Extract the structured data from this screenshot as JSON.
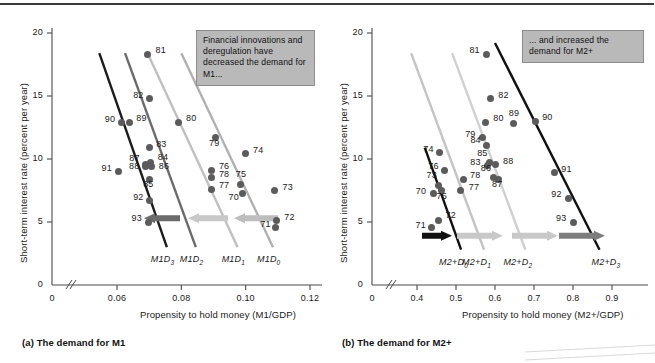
{
  "figure": {
    "top_rule": true
  },
  "panel_a": {
    "caption": "(a) The demand for M1",
    "note": "Financial innovations and deregulation have decreased the demand for M1...",
    "yaxis_title": "Short-term interest rate (percent per year)",
    "xaxis_title": "Propensity to hold money (M1/GDP)",
    "yticks": [
      "20",
      "15",
      "10",
      "5",
      "0"
    ],
    "xticks": [
      "0",
      "0.06",
      "0.08",
      "0.10",
      "0.12"
    ],
    "curve_labels": [
      {
        "base": "M1D",
        "sub": "3"
      },
      {
        "base": "M1D",
        "sub": "2"
      },
      {
        "base": "M1D",
        "sub": "1"
      },
      {
        "base": "M1D",
        "sub": "0"
      }
    ]
  },
  "panel_b": {
    "caption": "(b) The demand for M2+",
    "note": "... and increased the demand for M2+",
    "yaxis_title": "Short-term interest rate (percent per year)",
    "xaxis_title": "Propensity to hold money (M2+/GDP)",
    "yticks": [
      "20",
      "15",
      "10",
      "5",
      "0"
    ],
    "xticks": [
      "0",
      "0.4",
      "0.5",
      "0.6",
      "0.7",
      "0.8",
      "0.9"
    ],
    "curve_labels": [
      {
        "base": "M2+D",
        "sub": "0"
      },
      {
        "base": "M2+D",
        "sub": "1"
      },
      {
        "base": "M2+D",
        "sub": "2"
      },
      {
        "base": "M2+D",
        "sub": "3"
      }
    ]
  },
  "chart_data": [
    {
      "type": "scatter",
      "title": "(a) The demand for M1",
      "xlabel": "Propensity to hold money (M1/GDP)",
      "ylabel": "Short-term interest rate (percent per year)",
      "xlim": [
        0.05,
        0.125
      ],
      "ylim": [
        0,
        20
      ],
      "xticks": [
        0.06,
        0.08,
        0.1,
        0.12
      ],
      "yticks": [
        0,
        5,
        10,
        15,
        20
      ],
      "axis_break_x": true,
      "grid": false,
      "annotation": "Financial innovations and deregulation have decreased the demand for M1...",
      "points": [
        {
          "label": "81",
          "x": 0.0695,
          "y": 18.3
        },
        {
          "label": "82",
          "x": 0.07,
          "y": 14.8
        },
        {
          "label": "90",
          "x": 0.0615,
          "y": 12.9
        },
        {
          "label": "89",
          "x": 0.0638,
          "y": 12.9
        },
        {
          "label": "80",
          "x": 0.079,
          "y": 12.9
        },
        {
          "label": "79",
          "x": 0.0905,
          "y": 11.7
        },
        {
          "label": "83",
          "x": 0.07,
          "y": 10.9
        },
        {
          "label": "74",
          "x": 0.0998,
          "y": 10.4
        },
        {
          "label": "84",
          "x": 0.0705,
          "y": 9.7
        },
        {
          "label": "87",
          "x": 0.0688,
          "y": 9.6
        },
        {
          "label": "88",
          "x": 0.069,
          "y": 9.4
        },
        {
          "label": "86",
          "x": 0.0708,
          "y": 9.4
        },
        {
          "label": "76",
          "x": 0.0895,
          "y": 9.1
        },
        {
          "label": "91",
          "x": 0.0605,
          "y": 9.0
        },
        {
          "label": "78",
          "x": 0.0895,
          "y": 8.5
        },
        {
          "label": "85",
          "x": 0.07,
          "y": 8.4
        },
        {
          "label": "75",
          "x": 0.0985,
          "y": 8.0
        },
        {
          "label": "77",
          "x": 0.0895,
          "y": 7.6
        },
        {
          "label": "73",
          "x": 0.109,
          "y": 7.5
        },
        {
          "label": "70",
          "x": 0.099,
          "y": 7.3
        },
        {
          "label": "92",
          "x": 0.07,
          "y": 6.7
        },
        {
          "label": "72",
          "x": 0.1095,
          "y": 5.1
        },
        {
          "label": "93",
          "x": 0.0698,
          "y": 5.0
        },
        {
          "label": "71",
          "x": 0.1092,
          "y": 4.6
        }
      ],
      "curves": [
        {
          "name": "M1D3",
          "color": "#1c1c1c",
          "x0": 0.0545,
          "y0": 18.4,
          "x1": 0.0755,
          "y1": 3.0
        },
        {
          "name": "M1D2",
          "color": "#6b6b6b",
          "x0": 0.0625,
          "y0": 18.4,
          "x1": 0.0845,
          "y1": 3.0
        },
        {
          "name": "M1D1",
          "color": "#c0c0c0",
          "x0": 0.0695,
          "y0": 18.4,
          "x1": 0.0975,
          "y1": 3.0
        },
        {
          "name": "M1D0",
          "color": "#b0b0b0",
          "x0": 0.08,
          "y0": 18.4,
          "x1": 0.1085,
          "y1": 3.0
        }
      ],
      "shift_arrows": [
        {
          "direction": "left",
          "color": "#6b6b6b"
        },
        {
          "direction": "left",
          "color": "#c8c8c8"
        },
        {
          "direction": "left",
          "color": "#bdbdbd"
        }
      ]
    },
    {
      "type": "scatter",
      "title": "(b) The demand for M2+",
      "xlabel": "Propensity to hold money (M2+/GDP)",
      "ylabel": "Short-term interest rate (percent per year)",
      "xlim": [
        0.33,
        0.94
      ],
      "ylim": [
        0,
        20
      ],
      "xticks": [
        0.4,
        0.5,
        0.6,
        0.7,
        0.8,
        0.9
      ],
      "yticks": [
        0,
        5,
        10,
        15,
        20
      ],
      "axis_break_x": true,
      "grid": false,
      "annotation": "... and increased the demand for M2+",
      "points": [
        {
          "label": "81",
          "x": 0.578,
          "y": 18.3
        },
        {
          "label": "82",
          "x": 0.588,
          "y": 14.8
        },
        {
          "label": "80",
          "x": 0.575,
          "y": 12.9
        },
        {
          "label": "89",
          "x": 0.648,
          "y": 12.8
        },
        {
          "label": "90",
          "x": 0.703,
          "y": 13.0
        },
        {
          "label": "79",
          "x": 0.567,
          "y": 11.7
        },
        {
          "label": "84",
          "x": 0.578,
          "y": 11.1
        },
        {
          "label": "74",
          "x": 0.457,
          "y": 10.5
        },
        {
          "label": "85",
          "x": 0.585,
          "y": 9.7
        },
        {
          "label": "83",
          "x": 0.58,
          "y": 9.5
        },
        {
          "label": "88",
          "x": 0.6,
          "y": 9.6
        },
        {
          "label": "76",
          "x": 0.47,
          "y": 9.1
        },
        {
          "label": "91",
          "x": 0.752,
          "y": 8.9
        },
        {
          "label": "86",
          "x": 0.597,
          "y": 8.5
        },
        {
          "label": "78",
          "x": 0.518,
          "y": 8.4
        },
        {
          "label": "73",
          "x": 0.455,
          "y": 7.9
        },
        {
          "label": "87",
          "x": 0.608,
          "y": 8.4
        },
        {
          "label": "75",
          "x": 0.463,
          "y": 7.5
        },
        {
          "label": "77",
          "x": 0.512,
          "y": 7.5
        },
        {
          "label": "70",
          "x": 0.443,
          "y": 7.3
        },
        {
          "label": "92",
          "x": 0.788,
          "y": 6.9
        },
        {
          "label": "72",
          "x": 0.455,
          "y": 5.1
        },
        {
          "label": "93",
          "x": 0.8,
          "y": 5.0
        },
        {
          "label": "71",
          "x": 0.437,
          "y": 4.6
        }
      ],
      "curves": [
        {
          "name": "M2+D0",
          "color": "#111111",
          "x0": 0.42,
          "y0": 10.9,
          "x1": 0.513,
          "y1": 2.8
        },
        {
          "name": "M2+D1",
          "color": "#c4c4c4",
          "x0": 0.385,
          "y0": 18.4,
          "x1": 0.572,
          "y1": 2.8
        },
        {
          "name": "M2+D2",
          "color": "#d0d0d0",
          "x0": 0.49,
          "y0": 18.4,
          "x1": 0.678,
          "y1": 2.8
        },
        {
          "name": "M2+D3",
          "color": "#111111",
          "x0": 0.6,
          "y0": 19.2,
          "x1": 0.868,
          "y1": 2.8
        }
      ],
      "shift_arrows": [
        {
          "direction": "right",
          "color": "#111111"
        },
        {
          "direction": "right",
          "color": "#c8c8c8"
        },
        {
          "direction": "right",
          "color": "#7d7d7d"
        }
      ]
    }
  ]
}
